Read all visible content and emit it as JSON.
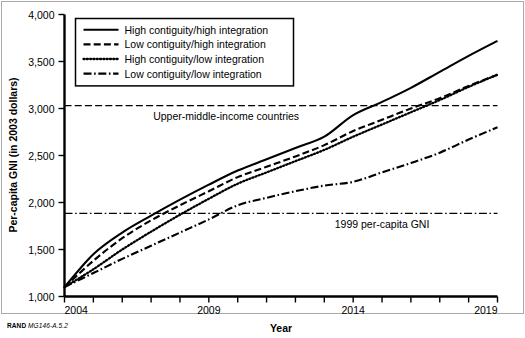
{
  "figure": {
    "footer_brand": "RAND",
    "footer_code": "MG146-A.5.2",
    "frame_color": "#aaaaaa",
    "axis_color": "#000000",
    "line_color": "#000000",
    "background": "#ffffff"
  },
  "chart_data": {
    "type": "line",
    "title": "",
    "xlabel": "Year",
    "ylabel": "Per-capita GNI (in 2003 dollars)",
    "xlim": [
      2004,
      2019
    ],
    "ylim": [
      1000,
      4000
    ],
    "ytick_labels": [
      "1,000",
      "1,500",
      "2,000",
      "2,500",
      "3,000",
      "3,500",
      "4,000"
    ],
    "ytick_values": [
      1000,
      1500,
      2000,
      2500,
      3000,
      3500,
      4000
    ],
    "xtick_labels": [
      "2004",
      "2009",
      "2014",
      "2019"
    ],
    "xtick_values": [
      2004,
      2009,
      2014,
      2019
    ],
    "xtick_minor": [
      2005,
      2006,
      2007,
      2008,
      2010,
      2011,
      2012,
      2013,
      2015,
      2016,
      2017,
      2018
    ],
    "grid": false,
    "legend_position": "top-left",
    "x": [
      2004,
      2005,
      2006,
      2007,
      2008,
      2009,
      2010,
      2011,
      2012,
      2013,
      2014,
      2015,
      2016,
      2017,
      2018,
      2019
    ],
    "series": [
      {
        "name": "High contiguity/high integration",
        "style": "solid",
        "values": [
          1100,
          1450,
          1680,
          1860,
          2030,
          2190,
          2340,
          2460,
          2580,
          2700,
          2930,
          3070,
          3220,
          3390,
          3560,
          3720
        ]
      },
      {
        "name": "Low contiguity/high integration",
        "style": "dashed",
        "values": [
          1100,
          1380,
          1620,
          1810,
          1970,
          2120,
          2270,
          2380,
          2490,
          2610,
          2760,
          2880,
          3000,
          3110,
          3240,
          3360
        ]
      },
      {
        "name": "High contiguity/low integration",
        "style": "dotted",
        "values": [
          1100,
          1290,
          1500,
          1690,
          1870,
          2040,
          2200,
          2320,
          2440,
          2560,
          2700,
          2830,
          2960,
          3090,
          3230,
          3360
        ]
      },
      {
        "name": "Low contiguity/low integration",
        "style": "dashdot",
        "values": [
          1100,
          1250,
          1400,
          1540,
          1680,
          1820,
          1970,
          2050,
          2120,
          2180,
          2220,
          2320,
          2420,
          2530,
          2670,
          2800
        ]
      }
    ],
    "reference_lines": [
      {
        "label": "Upper-middle-income countries",
        "value": 3030,
        "style": "dashed",
        "label_x": 2009.6
      },
      {
        "label": "1999 per-capita GNI",
        "value": 1885,
        "style": "dashdot",
        "label_x": 2015.0
      }
    ],
    "legend": [
      {
        "label": "High contiguity/high integration",
        "style": "solid"
      },
      {
        "label": "Low contiguity/high integration",
        "style": "dashed"
      },
      {
        "label": "High contiguity/low integration",
        "style": "dotted"
      },
      {
        "label": "Low contiguity/low integration",
        "style": "dashdot"
      }
    ]
  }
}
